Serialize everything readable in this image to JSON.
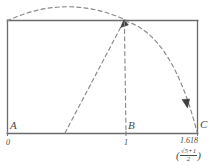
{
  "figure": {
    "background_color": "#ffffff",
    "stroke_color": "#6b6b6b",
    "dash_color": "#8a8a8a",
    "label_color": "#4a4a4a",
    "rect": {
      "left": 7,
      "top": 20,
      "right": 198,
      "bottom": 134
    }
  },
  "vertices": [
    {
      "name": "A",
      "label": "A",
      "x": 7,
      "y": 134
    },
    {
      "name": "B",
      "label": "B",
      "x": 126,
      "y": 134
    },
    {
      "name": "C",
      "label": "C",
      "x": 198,
      "y": 134
    }
  ],
  "axis": {
    "ticks": [
      {
        "label": "0",
        "x": 7,
        "value": 0
      },
      {
        "label": "1",
        "x": 126,
        "value": 1
      },
      {
        "label": "1.618",
        "x": 198,
        "value": 1.618
      }
    ]
  },
  "formula": {
    "open_paren": "(",
    "radical": "√5",
    "numerator": "√5+1",
    "denominator": "2",
    "close_paren": ")",
    "plain": "(√5+1)/2"
  },
  "construction": {
    "top_arc": {
      "description": "dashed arc over top edge from left corner to apex region",
      "from": [
        7,
        20
      ],
      "apex": [
        66,
        4
      ],
      "to": [
        126,
        20
      ]
    },
    "diagonal": {
      "description": "dashed diagonal with arrowhead from lower-left midpoint to top edge",
      "from": [
        65,
        134
      ],
      "to": [
        124,
        21
      ],
      "arrow_at": [
        124,
        21
      ]
    },
    "vertical": {
      "description": "dashed vertical drop from top intersection to point B",
      "from": [
        124,
        21
      ],
      "to": [
        126,
        133
      ]
    },
    "right_arc": {
      "description": "dashed arc with arrowhead sweeping from top intersection down to C",
      "from": [
        124,
        21
      ],
      "to": [
        197,
        133
      ],
      "arrow_at": [
        186,
        103
      ]
    }
  }
}
